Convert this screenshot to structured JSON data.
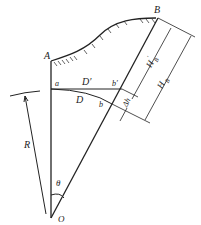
{
  "diagram": {
    "type": "geometry",
    "labels": {
      "A": "A",
      "B": "B",
      "a": "a",
      "b": "b",
      "b_prime": "b′",
      "D": "D",
      "D_prime": "D′",
      "delta_h": "Δh",
      "R": "R",
      "theta": "θ",
      "O": "O",
      "H_B_prime": "H",
      "H_B_prime_sub": "B",
      "H_B_prime_sup": "′",
      "H_B": "H",
      "H_B_sub": "B"
    },
    "colors": {
      "line": "#222222",
      "background": "#ffffff"
    }
  }
}
